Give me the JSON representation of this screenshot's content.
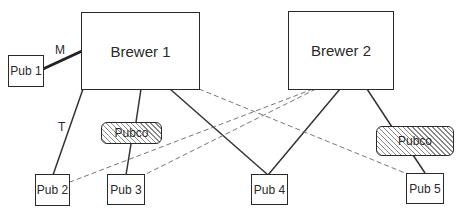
{
  "diagram": {
    "brewers": [
      {
        "id": "brewer1",
        "label": "Brewer 1"
      },
      {
        "id": "brewer2",
        "label": "Brewer 2"
      }
    ],
    "pubcos": [
      {
        "id": "pubco1",
        "label": "Pubco"
      },
      {
        "id": "pubco2",
        "label": "Pubco"
      }
    ],
    "pubs": [
      {
        "id": "pub1",
        "label": "Pub 1"
      },
      {
        "id": "pub2",
        "label": "Pub 2"
      },
      {
        "id": "pub3",
        "label": "Pub 3"
      },
      {
        "id": "pub4",
        "label": "Pub 4"
      },
      {
        "id": "pub5",
        "label": "Pub 5"
      }
    ],
    "edge_labels": {
      "m": "M",
      "t": "T"
    },
    "edges": [
      {
        "from": "brewer1",
        "to": "pub1",
        "style": "thick",
        "label": "M"
      },
      {
        "from": "brewer1",
        "to": "pub2",
        "style": "solid",
        "label": "T"
      },
      {
        "from": "brewer1",
        "to": "pubco1",
        "style": "solid"
      },
      {
        "from": "pubco1",
        "to": "pub3",
        "style": "solid"
      },
      {
        "from": "brewer1",
        "to": "pub4",
        "style": "solid"
      },
      {
        "from": "brewer1",
        "to": "pub5",
        "style": "dashed"
      },
      {
        "from": "brewer2",
        "to": "pub4",
        "style": "solid"
      },
      {
        "from": "brewer2",
        "to": "pubco2",
        "style": "solid"
      },
      {
        "from": "pubco2",
        "to": "pub5",
        "style": "solid"
      },
      {
        "from": "brewer2",
        "to": "pub2",
        "style": "dashed"
      },
      {
        "from": "brewer2",
        "to": "pub3",
        "style": "dashed"
      }
    ]
  }
}
